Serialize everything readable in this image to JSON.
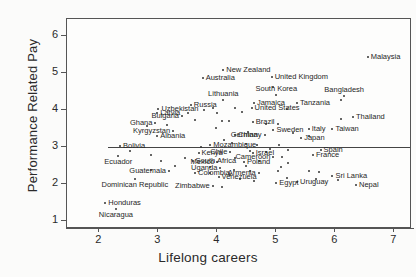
{
  "chart_data": {
    "type": "scatter",
    "title": "",
    "xlabel": "Lifelong careers",
    "ylabel": "Performance Related Pay",
    "xlim": [
      1.45,
      7.3
    ],
    "ylim": [
      0.78,
      6.45
    ],
    "xticks": [
      2,
      3,
      4,
      5,
      6,
      7
    ],
    "yticks": [
      1,
      2,
      3,
      4,
      5,
      6
    ],
    "grid": false,
    "legend": "none",
    "annotations": [
      {
        "type": "hline",
        "y": 3.0,
        "x_from": 2.15,
        "x_to": 7.3,
        "note": "horizontal reference line at Performance Related Pay = 3"
      }
    ],
    "point_label_field": "country",
    "points": [
      {
        "country": "Malaysia",
        "x": 6.55,
        "y": 5.42,
        "side": "right"
      },
      {
        "country": "New Zealand",
        "x": 4.1,
        "y": 5.08,
        "side": "right"
      },
      {
        "country": "United Kingdom",
        "x": 4.92,
        "y": 4.88,
        "side": "right"
      },
      {
        "country": "Australia",
        "x": 3.75,
        "y": 4.85,
        "side": "right"
      },
      {
        "country": "South Korea",
        "x": 5.0,
        "y": 4.4,
        "side": "below"
      },
      {
        "country": "Bangladesh",
        "x": 6.15,
        "y": 4.38,
        "side": "below"
      },
      {
        "country": "Lithuania",
        "x": 4.1,
        "y": 4.25,
        "side": "below"
      },
      {
        "country": "Tanzania",
        "x": 5.35,
        "y": 4.18,
        "side": "right"
      },
      {
        "country": "Jamaica",
        "x": 4.62,
        "y": 4.18,
        "side": "right"
      },
      {
        "country": "Russia",
        "x": 3.55,
        "y": 4.12,
        "side": "right"
      },
      {
        "country": "United States",
        "x": 4.58,
        "y": 4.05,
        "side": "right"
      },
      {
        "country": "Uzbekistan",
        "x": 3.0,
        "y": 4.02,
        "side": "right"
      },
      {
        "country": "Latvia",
        "x": 2.98,
        "y": 3.9,
        "side": "right"
      },
      {
        "country": "Bulgaria",
        "x": 3.4,
        "y": 3.82,
        "side": "left"
      },
      {
        "country": "Thailand",
        "x": 6.3,
        "y": 3.8,
        "side": "right"
      },
      {
        "country": "Brazil",
        "x": 4.6,
        "y": 3.66,
        "side": "right"
      },
      {
        "country": "Ghana",
        "x": 2.95,
        "y": 3.65,
        "side": "left"
      },
      {
        "country": "Italy",
        "x": 5.55,
        "y": 3.48,
        "side": "right"
      },
      {
        "country": "Taiwan",
        "x": 5.95,
        "y": 3.48,
        "side": "right"
      },
      {
        "country": "Sweden",
        "x": 4.95,
        "y": 3.45,
        "side": "right"
      },
      {
        "country": "Kyrgyzstan",
        "x": 3.25,
        "y": 3.42,
        "side": "left"
      },
      {
        "country": "Germany",
        "x": 4.8,
        "y": 3.32,
        "side": "left"
      },
      {
        "country": "China",
        "x": 4.3,
        "y": 3.32,
        "side": "right"
      },
      {
        "country": "Albania",
        "x": 2.98,
        "y": 3.28,
        "side": "right"
      },
      {
        "country": "Japan",
        "x": 5.42,
        "y": 3.24,
        "side": "right"
      },
      {
        "country": "Mozambique",
        "x": 3.88,
        "y": 3.06,
        "side": "right"
      },
      {
        "country": "Bolivia",
        "x": 2.35,
        "y": 3.02,
        "side": "right"
      },
      {
        "country": "Spain",
        "x": 5.75,
        "y": 2.9,
        "side": "right"
      },
      {
        "country": "Chile",
        "x": 4.22,
        "y": 2.85,
        "side": "left"
      },
      {
        "country": "Kenya",
        "x": 3.68,
        "y": 2.82,
        "side": "right"
      },
      {
        "country": "Israel",
        "x": 4.6,
        "y": 2.82,
        "side": "right"
      },
      {
        "country": "France",
        "x": 5.62,
        "y": 2.78,
        "side": "right"
      },
      {
        "country": "Ecuador",
        "x": 2.32,
        "y": 2.74,
        "side": "center"
      },
      {
        "country": "Cameroon",
        "x": 4.95,
        "y": 2.72,
        "side": "left"
      },
      {
        "country": "South Africa",
        "x": 3.58,
        "y": 2.62,
        "side": "right"
      },
      {
        "country": "Mexico",
        "x": 4.0,
        "y": 2.6,
        "side": "left"
      },
      {
        "country": "Poland",
        "x": 4.45,
        "y": 2.6,
        "side": "right"
      },
      {
        "country": "Uganda",
        "x": 4.05,
        "y": 2.42,
        "side": "left"
      },
      {
        "country": "Guatemala",
        "x": 3.18,
        "y": 2.35,
        "side": "left"
      },
      {
        "country": "Colombia",
        "x": 3.62,
        "y": 2.3,
        "side": "right"
      },
      {
        "country": "Armenia",
        "x": 4.7,
        "y": 2.3,
        "side": "left"
      },
      {
        "country": "Sri Lanka",
        "x": 5.95,
        "y": 2.22,
        "side": "right"
      },
      {
        "country": "Venezuela",
        "x": 4.02,
        "y": 2.18,
        "side": "right"
      },
      {
        "country": "Dominican Republic",
        "x": 2.6,
        "y": 2.14,
        "side": "center"
      },
      {
        "country": "Uruguay",
        "x": 5.35,
        "y": 2.05,
        "side": "right"
      },
      {
        "country": "Egypt",
        "x": 5.0,
        "y": 2.02,
        "side": "right"
      },
      {
        "country": "Nepal",
        "x": 6.35,
        "y": 1.98,
        "side": "right"
      },
      {
        "country": "Zimbabwe",
        "x": 3.92,
        "y": 1.95,
        "side": "left"
      },
      {
        "country": "Honduras",
        "x": 2.1,
        "y": 1.48,
        "side": "right"
      },
      {
        "country": "Nicaragua",
        "x": 2.28,
        "y": 1.32,
        "side": "center"
      }
    ],
    "unlabeled_points": [
      {
        "x": 4.95,
        "y": 4.62
      },
      {
        "x": 4.3,
        "y": 4.05
      },
      {
        "x": 3.92,
        "y": 4.05
      },
      {
        "x": 3.78,
        "y": 4.0
      },
      {
        "x": 3.5,
        "y": 3.92
      },
      {
        "x": 4.0,
        "y": 3.9
      },
      {
        "x": 4.42,
        "y": 3.95
      },
      {
        "x": 5.18,
        "y": 4.02
      },
      {
        "x": 3.62,
        "y": 3.72
      },
      {
        "x": 4.08,
        "y": 3.7
      },
      {
        "x": 4.2,
        "y": 3.7
      },
      {
        "x": 4.82,
        "y": 3.62
      },
      {
        "x": 5.02,
        "y": 3.62
      },
      {
        "x": 3.15,
        "y": 3.58
      },
      {
        "x": 2.8,
        "y": 3.55
      },
      {
        "x": 3.98,
        "y": 3.52
      },
      {
        "x": 4.52,
        "y": 3.4
      },
      {
        "x": 5.28,
        "y": 3.38
      },
      {
        "x": 5.55,
        "y": 3.3
      },
      {
        "x": 4.12,
        "y": 3.18
      },
      {
        "x": 4.25,
        "y": 3.1
      },
      {
        "x": 4.48,
        "y": 3.08
      },
      {
        "x": 4.68,
        "y": 3.06
      },
      {
        "x": 5.05,
        "y": 3.06
      },
      {
        "x": 3.72,
        "y": 3.0
      },
      {
        "x": 4.9,
        "y": 2.95
      },
      {
        "x": 5.2,
        "y": 2.92
      },
      {
        "x": 4.55,
        "y": 2.88
      },
      {
        "x": 4.82,
        "y": 2.86
      },
      {
        "x": 2.88,
        "y": 2.78
      },
      {
        "x": 5.1,
        "y": 2.72
      },
      {
        "x": 4.3,
        "y": 2.7
      },
      {
        "x": 3.45,
        "y": 2.7
      },
      {
        "x": 4.7,
        "y": 2.62
      },
      {
        "x": 5.2,
        "y": 2.55
      },
      {
        "x": 4.48,
        "y": 2.48
      },
      {
        "x": 3.28,
        "y": 2.48
      },
      {
        "x": 3.88,
        "y": 2.45
      },
      {
        "x": 5.08,
        "y": 2.45
      },
      {
        "x": 4.28,
        "y": 2.38
      },
      {
        "x": 4.55,
        "y": 2.35
      },
      {
        "x": 5.02,
        "y": 2.35
      },
      {
        "x": 5.55,
        "y": 2.35
      },
      {
        "x": 3.88,
        "y": 2.28
      },
      {
        "x": 4.22,
        "y": 2.25
      },
      {
        "x": 5.72,
        "y": 2.32
      },
      {
        "x": 4.38,
        "y": 2.12
      },
      {
        "x": 4.62,
        "y": 2.08
      },
      {
        "x": 5.18,
        "y": 2.15
      },
      {
        "x": 5.68,
        "y": 2.12
      },
      {
        "x": 6.05,
        "y": 2.1
      },
      {
        "x": 4.08,
        "y": 1.92
      },
      {
        "x": 2.88,
        "y": 2.38
      },
      {
        "x": 3.05,
        "y": 2.62
      },
      {
        "x": 2.52,
        "y": 2.88
      },
      {
        "x": 6.1,
        "y": 3.75
      },
      {
        "x": 6.1,
        "y": 4.25
      }
    ]
  }
}
